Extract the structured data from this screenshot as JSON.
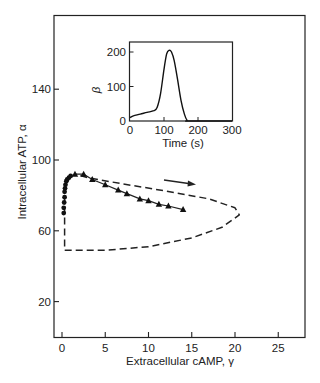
{
  "chart_data": [
    {
      "id": "main",
      "type": "line",
      "title": "",
      "xlabel": "Extracellular cAMP, γ",
      "ylabel": "Intracellular ATP, α",
      "xlim": [
        -1,
        28
      ],
      "ylim": [
        0,
        180
      ],
      "xticks": [
        0,
        5,
        10,
        15,
        20,
        25
      ],
      "yticks": [
        20,
        60,
        100,
        140
      ],
      "grid": false,
      "series": [
        {
          "name": "experimental (circles)",
          "marker": "circle",
          "x": [
            0.2,
            0.2,
            0.25,
            0.3,
            0.3,
            0.35,
            0.4,
            0.5,
            0.6,
            0.8,
            1.0
          ],
          "y": [
            70,
            73,
            76,
            79,
            82,
            84,
            86,
            88,
            89,
            90,
            91
          ]
        },
        {
          "name": "experimental (triangles)",
          "marker": "triangle",
          "x": [
            1.5,
            2.5,
            3.5,
            5.0,
            6.5,
            7.5,
            9.0,
            10.0,
            11.2,
            12.3,
            14.0
          ],
          "y": [
            92,
            92,
            89,
            86,
            83,
            81,
            78,
            77,
            75,
            74,
            72
          ]
        },
        {
          "name": "theoretical limit cycle",
          "style": "dashed",
          "x": [
            0.3,
            0.3,
            0.3,
            5,
            10,
            15,
            18.5,
            20.5,
            20,
            17,
            12,
            7,
            3,
            1.5
          ],
          "y": [
            80,
            60,
            49,
            49,
            51,
            56,
            62,
            69,
            73,
            78,
            82.5,
            86.5,
            90,
            92
          ]
        }
      ],
      "annotations": [
        {
          "type": "arrow",
          "direction": "right",
          "from": [
            10.5,
            93
          ],
          "to": [
            15,
            90.5
          ]
        }
      ]
    },
    {
      "id": "inset",
      "type": "line",
      "title": "",
      "xlabel": "Time (s)",
      "ylabel": "β",
      "xlim": [
        0,
        300
      ],
      "ylim": [
        0,
        230
      ],
      "xticks": [
        0,
        100,
        200,
        300
      ],
      "yticks": [
        0,
        100,
        200
      ],
      "grid": false,
      "series": [
        {
          "name": "β(t)",
          "x": [
            0,
            10,
            30,
            50,
            70,
            80,
            90,
            100,
            108,
            115,
            122,
            130,
            140,
            150,
            160,
            168,
            175,
            300
          ],
          "y": [
            10,
            15,
            20,
            25,
            30,
            40,
            80,
            150,
            195,
            205,
            200,
            175,
            120,
            60,
            20,
            2,
            0,
            0
          ]
        }
      ]
    }
  ],
  "labels": {
    "main_xlabel": "Extracellular cAMP, γ",
    "main_ylabel": "Intracellular ATP, α",
    "inset_xlabel": "Time (s)",
    "inset_ylabel": "β",
    "main_xticks": [
      "0",
      "5",
      "10",
      "15",
      "20",
      "25"
    ],
    "main_yticks": [
      "20",
      "60",
      "100",
      "140"
    ],
    "inset_xticks": [
      "0",
      "100",
      "200",
      "300"
    ],
    "inset_yticks": [
      "0",
      "100",
      "200"
    ]
  }
}
